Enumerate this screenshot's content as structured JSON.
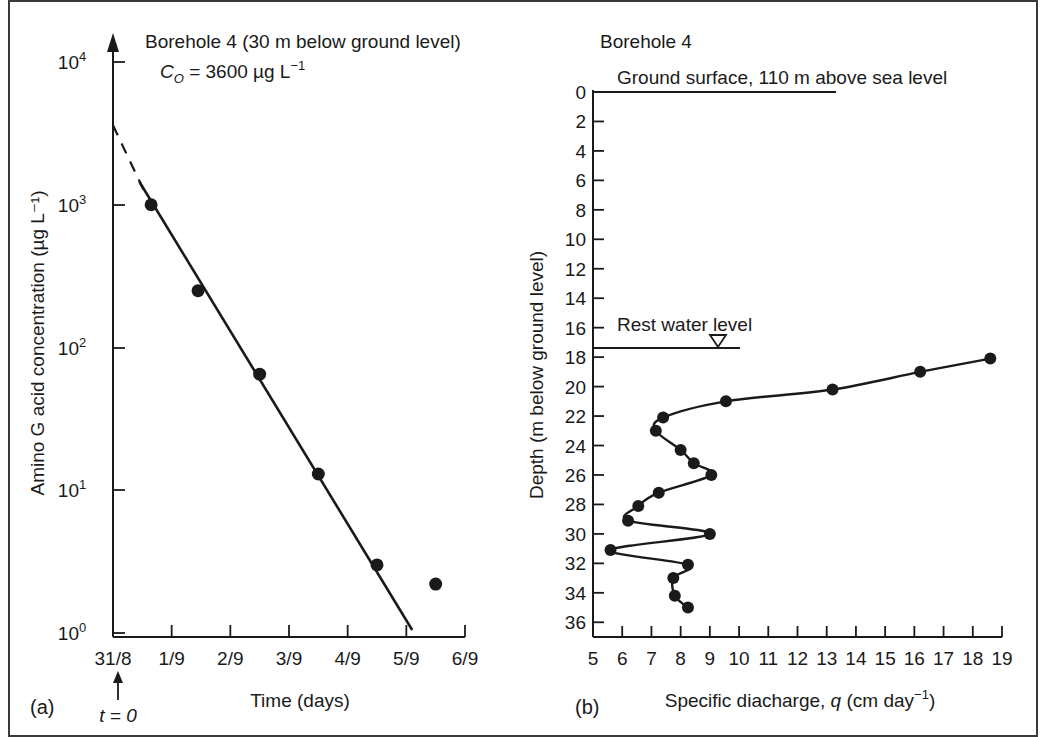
{
  "figure": {
    "panel_a_label": "(a)",
    "panel_b_label": "(b)"
  },
  "panel_a": {
    "title_line1": "Borehole 4 (30 m below ground level)",
    "title_c0_prefix": "C",
    "title_c0_sub": "O",
    "title_c0_value": " = 3600 µg L",
    "title_c0_sup": "−1",
    "t_zero_label": "t = 0",
    "chart_data": {
      "type": "scatter",
      "title": "Borehole 4 (30 m below ground level)",
      "xlabel": "Time (days)",
      "ylabel": "Amino G acid concentration (µg L⁻¹)",
      "yscale": "log",
      "ylim": [
        1,
        10000
      ],
      "ytick_labels": [
        "10⁰",
        "10¹",
        "10²",
        "10³",
        "10⁴"
      ],
      "ytick_values": [
        1,
        10,
        100,
        1000,
        10000
      ],
      "xtick_labels": [
        "31/8",
        "1/9",
        "2/9",
        "3/9",
        "4/9",
        "5/9",
        "6/9"
      ],
      "xtick_values": [
        0,
        1,
        2,
        3,
        4,
        5,
        6
      ],
      "xlim": [
        0,
        6
      ],
      "grid": false,
      "legend": "none",
      "initial_concentration": 3600,
      "points": [
        {
          "x": 0.65,
          "y": 1000
        },
        {
          "x": 1.45,
          "y": 250
        },
        {
          "x": 2.5,
          "y": 65
        },
        {
          "x": 3.5,
          "y": 13
        },
        {
          "x": 4.5,
          "y": 3.0
        },
        {
          "x": 5.5,
          "y": 2.2
        }
      ],
      "fit_line": {
        "x_start": 0.45,
        "y_start": 1450,
        "x_end": 5.1,
        "y_end": 1.05
      },
      "extrapolated_line": {
        "x_start": 0.0,
        "y_start": 3600,
        "x_end": 0.55,
        "y_end": 1200
      }
    }
  },
  "panel_b": {
    "title": "Borehole 4",
    "ground_surface_label": "Ground surface, 110 m above sea level",
    "rest_water_level_label": "Rest water level",
    "chart_data": {
      "type": "line",
      "title": "Borehole 4",
      "xlabel": "Specific diacharge, q (cm day⁻¹)",
      "ylabel": "Depth (m below ground level)",
      "xlim": [
        5,
        19
      ],
      "ylim": [
        0,
        37
      ],
      "y_inverted": true,
      "xtick_values": [
        5,
        6,
        7,
        8,
        9,
        10,
        11,
        12,
        13,
        14,
        15,
        16,
        17,
        18,
        19
      ],
      "xtick_labels": [
        "5",
        "6",
        "7",
        "8",
        "9",
        "10",
        "11",
        "12",
        "13",
        "14",
        "15",
        "16",
        "17",
        "18",
        "19"
      ],
      "ytick_values": [
        0,
        2,
        4,
        6,
        8,
        10,
        12,
        14,
        16,
        18,
        20,
        22,
        24,
        26,
        28,
        30,
        32,
        34,
        36
      ],
      "ytick_labels": [
        "0",
        "2",
        "4",
        "6",
        "8",
        "10",
        "12",
        "14",
        "16",
        "18",
        "20",
        "22",
        "24",
        "26",
        "28",
        "30",
        "32",
        "34",
        "36"
      ],
      "grid": false,
      "legend": "none",
      "ground_surface_depth": 0,
      "rest_water_level_depth": 17.6,
      "points": [
        {
          "q": 18.6,
          "depth": 18.1
        },
        {
          "q": 16.2,
          "depth": 19.0
        },
        {
          "q": 13.2,
          "depth": 20.2
        },
        {
          "q": 9.55,
          "depth": 21.0
        },
        {
          "q": 7.4,
          "depth": 22.1
        },
        {
          "q": 7.15,
          "depth": 23.0
        },
        {
          "q": 8.0,
          "depth": 24.3
        },
        {
          "q": 8.45,
          "depth": 25.2
        },
        {
          "q": 9.05,
          "depth": 26.0
        },
        {
          "q": 7.25,
          "depth": 27.2
        },
        {
          "q": 6.55,
          "depth": 28.1
        },
        {
          "q": 6.2,
          "depth": 29.1
        },
        {
          "q": 9.0,
          "depth": 30.0
        },
        {
          "q": 5.6,
          "depth": 31.1
        },
        {
          "q": 8.25,
          "depth": 32.1
        },
        {
          "q": 7.75,
          "depth": 33.0
        },
        {
          "q": 7.8,
          "depth": 34.2
        },
        {
          "q": 8.25,
          "depth": 35.0
        }
      ]
    }
  }
}
